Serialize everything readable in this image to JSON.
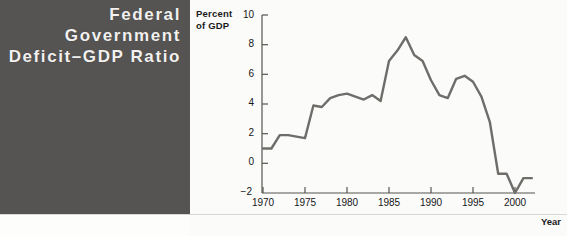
{
  "title": {
    "lines": [
      "Federal",
      "Government",
      "Deficit–GDP Ratio"
    ],
    "panel_color": "#555453",
    "text_color": "#f2f1ef"
  },
  "chart_data": {
    "type": "line",
    "title": "Federal Government Deficit–GDP Ratio",
    "xlabel": "Year",
    "ylabel": "Percent of GDP",
    "ylabel_lines": [
      "Percent",
      "of GDP"
    ],
    "xlim": [
      1969,
      2003
    ],
    "ylim": [
      -2,
      10
    ],
    "yticks": [
      -2,
      0,
      2,
      4,
      6,
      8,
      10
    ],
    "ytick_labels": [
      "−2",
      "0",
      "2",
      "4",
      "6",
      "8",
      "10"
    ],
    "xticks": [
      1970,
      1975,
      1980,
      1985,
      1990,
      1995,
      2000
    ],
    "xtick_labels": [
      "1970",
      "1975",
      "1980",
      "1985",
      "1990",
      "1995",
      "2000"
    ],
    "grid": false,
    "legend": false,
    "line_color": "#6e6d6a",
    "line_width": 2.4,
    "series": [
      {
        "name": "Federal deficit as percent of GDP",
        "x": [
          1970,
          1971,
          1972,
          1973,
          1974,
          1975,
          1976,
          1977,
          1978,
          1979,
          1980,
          1981,
          1982,
          1983,
          1984,
          1985,
          1986,
          1987,
          1988,
          1989,
          1990,
          1991,
          1992,
          1993,
          1994,
          1995,
          1996,
          1997,
          1998,
          1999,
          2000,
          2001,
          2002
        ],
        "values": [
          1.0,
          1.0,
          1.9,
          1.9,
          1.8,
          1.7,
          3.9,
          3.8,
          4.4,
          4.6,
          4.7,
          4.5,
          4.3,
          4.6,
          4.2,
          6.9,
          7.6,
          8.5,
          7.3,
          6.9,
          5.6,
          4.6,
          4.4,
          5.7,
          5.9,
          5.5,
          4.5,
          2.8,
          -0.7,
          -0.7,
          -2.0,
          -1.0,
          -1.0
        ]
      }
    ]
  }
}
